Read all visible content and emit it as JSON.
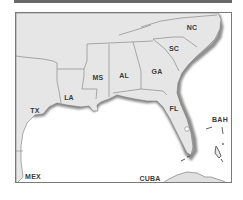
{
  "map": {
    "region": "Southeastern United States and Gulf of Mexico",
    "colors": {
      "land": "#e6e6e6",
      "border": "#8a8a8a",
      "coast_shadow": "#9a9a9a",
      "water": "#ffffff",
      "label": "#3a3a3a",
      "frame": "#7a7a7a",
      "top_bar": "#6a6a6a"
    },
    "labels": {
      "nc": "NC",
      "sc": "SC",
      "ga": "GA",
      "al": "AL",
      "ms": "MS",
      "la": "LA",
      "tx": "TX",
      "fl": "FL",
      "bah": "BAH",
      "mex": "MEX",
      "cuba": "CUBA"
    }
  }
}
